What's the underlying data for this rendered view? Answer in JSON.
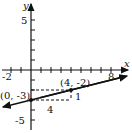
{
  "diagram": {
    "type": "coordinate-plane-line",
    "axes": {
      "x_label": "x",
      "y_label": "y",
      "x_tick_labels": [
        "-2",
        "8"
      ],
      "y_tick_labels": [
        "5",
        "-5"
      ]
    },
    "points": [
      {
        "label": "(0, -3)",
        "x": 0,
        "y": -3
      },
      {
        "label": "(4, -2)",
        "x": 4,
        "y": -2
      }
    ],
    "slope_triangle": {
      "run_label": "4",
      "rise_label": "1"
    },
    "line": {
      "slope": 0.25,
      "intercept": -3
    },
    "color": "#111111"
  }
}
